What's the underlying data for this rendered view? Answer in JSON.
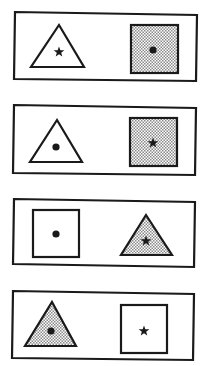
{
  "colors": {
    "stroke": "#1a1a1a",
    "shade_light": "#ffffff",
    "shade_dot": "#8a8a8a",
    "background": "#ffffff"
  },
  "panels": [
    {
      "id": "panel-1",
      "frame": {
        "x1": 15,
        "y1": 12,
        "x2": 197,
        "y2": 15,
        "x3": 196,
        "y3": 81,
        "x4": 14,
        "y4": 79
      },
      "left": {
        "shape": "triangle",
        "fill": "white",
        "marker": "star",
        "apex": [
          59,
          25
        ],
        "base_left": [
          31,
          67
        ],
        "base_right": [
          84,
          67
        ],
        "marker_pos": [
          59,
          52
        ]
      },
      "right": {
        "shape": "square",
        "fill": "shaded",
        "marker": "dot",
        "x": 131,
        "y": 25,
        "w": 47,
        "h": 48,
        "marker_pos": [
          153,
          50
        ]
      }
    },
    {
      "id": "panel-2",
      "frame": {
        "x1": 14,
        "y1": 105,
        "x2": 196,
        "y2": 108,
        "x3": 195,
        "y3": 175,
        "x4": 13,
        "y4": 173
      },
      "left": {
        "shape": "triangle",
        "fill": "white",
        "marker": "dot",
        "apex": [
          57,
          120
        ],
        "base_left": [
          30,
          162
        ],
        "base_right": [
          82,
          162
        ],
        "marker_pos": [
          56,
          147
        ]
      },
      "right": {
        "shape": "square",
        "fill": "shaded",
        "marker": "star",
        "x": 130,
        "y": 118,
        "w": 47,
        "h": 48,
        "marker_pos": [
          153,
          143
        ]
      }
    },
    {
      "id": "panel-3",
      "frame": {
        "x1": 14,
        "y1": 199,
        "x2": 195,
        "y2": 202,
        "x3": 194,
        "y3": 267,
        "x4": 13,
        "y4": 264
      },
      "left": {
        "shape": "square",
        "fill": "white",
        "marker": "dot",
        "x": 33,
        "y": 210,
        "w": 46,
        "h": 47,
        "marker_pos": [
          56,
          234
        ]
      },
      "right": {
        "shape": "triangle",
        "fill": "shaded",
        "marker": "star",
        "apex": [
          146,
          215
        ],
        "base_left": [
          121,
          255
        ],
        "base_right": [
          172,
          255
        ],
        "marker_pos": [
          146,
          241
        ]
      }
    },
    {
      "id": "panel-4",
      "frame": {
        "x1": 13,
        "y1": 291,
        "x2": 194,
        "y2": 294,
        "x3": 193,
        "y3": 360,
        "x4": 12,
        "y4": 358
      },
      "left": {
        "shape": "triangle",
        "fill": "shaded",
        "marker": "dot",
        "apex": [
          52,
          302
        ],
        "base_left": [
          25,
          346
        ],
        "base_right": [
          76,
          346
        ],
        "marker_pos": [
          51,
          331
        ]
      },
      "right": {
        "shape": "square",
        "fill": "white",
        "marker": "star",
        "x": 121,
        "y": 305,
        "w": 46,
        "h": 48,
        "marker_pos": [
          144,
          331
        ]
      }
    }
  ]
}
